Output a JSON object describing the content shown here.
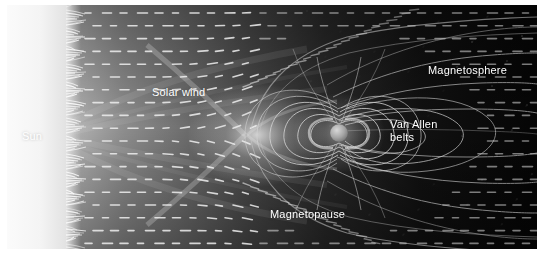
{
  "figure": {
    "style": "grayscale scientific illustration",
    "canvas": {
      "x": 7,
      "y": 5,
      "width": 530,
      "height": 244
    },
    "background_color": "#000000",
    "page_color": "#ffffff"
  },
  "labels": [
    {
      "id": "sun",
      "text": "Sun",
      "x": 15,
      "y": 125,
      "color": "#ffffff"
    },
    {
      "id": "solar-wind",
      "text": "Solar wind",
      "x": 145,
      "y": 81,
      "color": "#ffffff"
    },
    {
      "id": "magnetosphere",
      "text": "Magnetosphere",
      "x": 421,
      "y": 59,
      "color": "#ffffff"
    },
    {
      "id": "van-allen-belts",
      "text": "Van Allen\nbelts",
      "x": 383,
      "y": 113,
      "color": "#ffffff"
    },
    {
      "id": "magnetopause",
      "text": "Magnetopause",
      "x": 263,
      "y": 203,
      "color": "#ffffff"
    }
  ],
  "scene": {
    "sun": {
      "name": "Sun",
      "limb_x": 62,
      "glow_color": "#f2f2f2",
      "prominences": 120,
      "description": "bright solar limb with spiky prominences at left edge"
    },
    "earth": {
      "name": "Earth",
      "cx": 332,
      "cy": 128,
      "radius": 9,
      "color": "#9a9a9a"
    },
    "bow_shock": {
      "name": "bow-shock",
      "apex_x": 238,
      "apex_y": 130,
      "color": "#d8d8d8"
    },
    "solar_wind_flow": {
      "direction": "left-to-right",
      "dash_color": "#e6e6e6",
      "dash_rows": 19,
      "dash_cols": 28
    },
    "van_allen_belts": {
      "count": 11,
      "color": "#cfcfcf"
    },
    "magnetotail": {
      "lobes": 6,
      "color": "#b9b9b9",
      "extends_to_x": 530
    }
  },
  "chart_data": {
    "type": "diagram",
    "elements": [
      "Sun",
      "Solar wind",
      "Magnetopause",
      "Van Allen belts",
      "Magnetosphere"
    ]
  }
}
